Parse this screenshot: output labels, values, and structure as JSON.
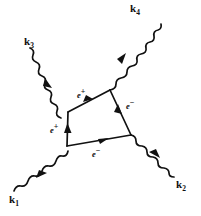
{
  "figure": {
    "kind": "feynman-diagram",
    "background_color": "#ffffff",
    "ink_color": "#111111",
    "width": 201,
    "height": 216
  },
  "external_lines": [
    {
      "id": "k1",
      "label": "k",
      "subscript": "1",
      "type": "photon-wavy",
      "label_x": 9,
      "label_y": 196,
      "from": [
        14,
        191
      ],
      "to": [
        67,
        146
      ],
      "arrow_at": 0.5,
      "arrow_direction": "inward"
    },
    {
      "id": "k2",
      "label": "k",
      "subscript": "2",
      "type": "photon-wavy",
      "label_x": 175,
      "label_y": 180,
      "from": [
        131,
        135
      ],
      "to": [
        188,
        176
      ],
      "arrow_at": 0.5,
      "arrow_direction": "outward"
    },
    {
      "id": "k3",
      "label": "k",
      "subscript": "3",
      "type": "photon-wavy",
      "label_x": 24,
      "label_y": 37,
      "from": [
        30,
        48
      ],
      "to": [
        68,
        112
      ],
      "arrow_at": 0.5,
      "arrow_direction": "inward"
    },
    {
      "id": "k4",
      "label": "k",
      "subscript": "4",
      "type": "photon-wavy",
      "label_x": 131,
      "label_y": 4,
      "from": [
        110,
        90
      ],
      "to": [
        135,
        17
      ],
      "arrow_at": 0.5,
      "arrow_direction": "outward"
    }
  ],
  "loop": {
    "type": "fermion-box",
    "vertices": {
      "top_left": [
        68,
        112
      ],
      "top_right": [
        110,
        90
      ],
      "bottom_right": [
        131,
        135
      ],
      "bottom_left": [
        67,
        146
      ]
    },
    "edges": [
      {
        "id": "loop-top",
        "label": "e",
        "charge": "+",
        "from": "bottom_left-ish top_left",
        "p1": [
          68,
          112
        ],
        "p2": [
          110,
          90
        ],
        "label_x": 78,
        "label_y": 92,
        "arrow_direction": "up-right"
      },
      {
        "id": "loop-right",
        "label": "e",
        "charge": "−",
        "p1": [
          131,
          135
        ],
        "p2": [
          110,
          90
        ],
        "label_x": 126,
        "label_y": 103,
        "arrow_direction": "up-left"
      },
      {
        "id": "loop-bottom",
        "label": "e",
        "charge": "−",
        "p1": [
          67,
          146
        ],
        "p2": [
          131,
          135
        ],
        "label_x": 94,
        "label_y": 150,
        "arrow_direction": "right"
      },
      {
        "id": "loop-left",
        "label": "e",
        "charge": "+",
        "p1": [
          67,
          146
        ],
        "p2": [
          68,
          112
        ],
        "label_x": 52,
        "label_y": 126,
        "arrow_direction": "up"
      }
    ]
  }
}
